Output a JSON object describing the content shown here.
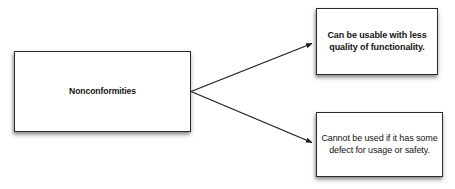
{
  "diagram": {
    "type": "branching-concept-map",
    "background_color": "#ffffff",
    "line_color": "#1c1c1c",
    "box_border_color": "#2b2b2b",
    "box_fill_color": "#ffffff",
    "text_color": "#141414",
    "root": {
      "label": "Nonconformities"
    },
    "branches": [
      {
        "id": "branch-1",
        "label": "Can be usable with less quality of functionality.",
        "emphasis": "bold"
      },
      {
        "id": "branch-2",
        "label": "Cannot be used if it has some defect for usage or safety.",
        "emphasis": "normal"
      }
    ],
    "connectors": [
      {
        "id": "connector-1",
        "from": "root",
        "to": "branch-1",
        "arrowhead": "filled-triangle"
      },
      {
        "id": "connector-2",
        "from": "root",
        "to": "branch-2",
        "arrowhead": "filled-triangle"
      }
    ]
  }
}
